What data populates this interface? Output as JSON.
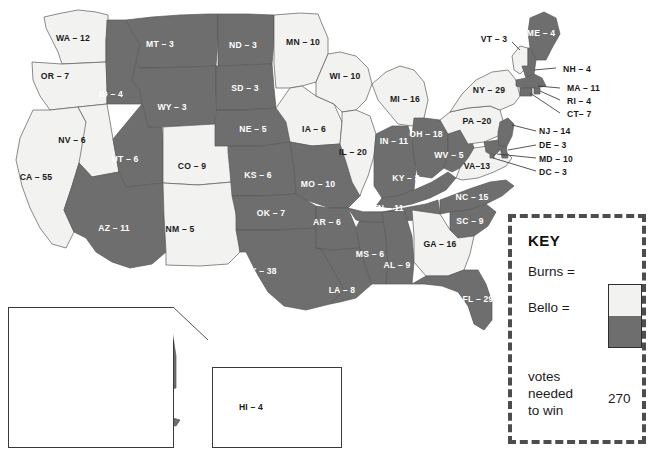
{
  "colors": {
    "burns": "#f2f2f0",
    "bello": "#6e6e6e",
    "background": "#ffffff",
    "border": "#5a5a5a",
    "key_border": "#4d4d4d"
  },
  "key": {
    "title": "KEY",
    "burns_label": "Burns =",
    "bello_label": "Bello =",
    "note_line1": "votes",
    "note_line2": "needed",
    "note_line3": "to win",
    "votes_needed": "270"
  },
  "states": [
    {
      "code": "WA",
      "votes": 12,
      "label": "WA – 12",
      "winner": "burns",
      "x": 73,
      "y": 38,
      "style": "lab-light"
    },
    {
      "code": "OR",
      "votes": 7,
      "label": "OR – 7",
      "winner": "burns",
      "x": 55,
      "y": 76,
      "style": "lab-light"
    },
    {
      "code": "CA",
      "votes": 55,
      "label": "CA – 55",
      "winner": "burns",
      "x": 36,
      "y": 177,
      "style": "lab-light"
    },
    {
      "code": "NV",
      "votes": 6,
      "label": "NV – 6",
      "winner": "burns",
      "x": 72,
      "y": 140,
      "style": "lab-light"
    },
    {
      "code": "ID",
      "votes": 4,
      "label": "ID – 4",
      "winner": "bello",
      "x": 111,
      "y": 94,
      "style": "lab-dark"
    },
    {
      "code": "MT",
      "votes": 3,
      "label": "MT – 3",
      "winner": "bello",
      "x": 160,
      "y": 44,
      "style": "lab-dark"
    },
    {
      "code": "WY",
      "votes": 3,
      "label": "WY – 3",
      "winner": "bello",
      "x": 172,
      "y": 107,
      "style": "lab-dark"
    },
    {
      "code": "UT",
      "votes": 6,
      "label": "UT – 6",
      "winner": "bello",
      "x": 125,
      "y": 159,
      "style": "lab-dark"
    },
    {
      "code": "CO",
      "votes": 9,
      "label": "CO – 9",
      "winner": "burns",
      "x": 192,
      "y": 166,
      "style": "lab-light"
    },
    {
      "code": "AZ",
      "votes": 11,
      "label": "AZ – 11",
      "winner": "bello",
      "x": 114,
      "y": 228,
      "style": "lab-dark"
    },
    {
      "code": "NM",
      "votes": 5,
      "label": "NM – 5",
      "winner": "burns",
      "x": 180,
      "y": 229,
      "style": "lab-light"
    },
    {
      "code": "ND",
      "votes": 3,
      "label": "ND – 3",
      "winner": "bello",
      "x": 243,
      "y": 45,
      "style": "lab-dark"
    },
    {
      "code": "SD",
      "votes": 3,
      "label": "SD – 3",
      "winner": "bello",
      "x": 245,
      "y": 88,
      "style": "lab-dark"
    },
    {
      "code": "NE",
      "votes": 5,
      "label": "NE – 5",
      "winner": "bello",
      "x": 253,
      "y": 129,
      "style": "lab-dark"
    },
    {
      "code": "KS",
      "votes": 6,
      "label": "KS – 6",
      "winner": "bello",
      "x": 258,
      "y": 175,
      "style": "lab-dark"
    },
    {
      "code": "OK",
      "votes": 7,
      "label": "OK – 7",
      "winner": "bello",
      "x": 271,
      "y": 213,
      "style": "lab-dark"
    },
    {
      "code": "TX",
      "votes": 38,
      "label": "TX – 38",
      "winner": "bello",
      "x": 261,
      "y": 271,
      "style": "lab-dark"
    },
    {
      "code": "MN",
      "votes": 10,
      "label": "MN – 10",
      "winner": "burns",
      "x": 303,
      "y": 42,
      "style": "lab-light"
    },
    {
      "code": "IA",
      "votes": 6,
      "label": "IA – 6",
      "winner": "burns",
      "x": 314,
      "y": 129,
      "style": "lab-light"
    },
    {
      "code": "MO",
      "votes": 10,
      "label": "MO – 10",
      "winner": "bello",
      "x": 318,
      "y": 184,
      "style": "lab-dark"
    },
    {
      "code": "AR",
      "votes": 6,
      "label": "AR – 6",
      "winner": "bello",
      "x": 327,
      "y": 222,
      "style": "lab-dark"
    },
    {
      "code": "LA",
      "votes": 8,
      "label": "LA – 8",
      "winner": "bello",
      "x": 342,
      "y": 290,
      "style": "lab-dark"
    },
    {
      "code": "WI",
      "votes": 10,
      "label": "WI – 10",
      "winner": "burns",
      "x": 345,
      "y": 76,
      "style": "lab-light"
    },
    {
      "code": "IL",
      "votes": 20,
      "label": "IL – 20",
      "winner": "burns",
      "x": 353,
      "y": 152,
      "style": "lab-light"
    },
    {
      "code": "MS",
      "votes": 6,
      "label": "MS – 6",
      "winner": "bello",
      "x": 370,
      "y": 254,
      "style": "lab-dark"
    },
    {
      "code": "TN",
      "votes": 11,
      "label": "TN – 11",
      "winner": "bello",
      "x": 388,
      "y": 208,
      "style": "lab-dark"
    },
    {
      "code": "MI",
      "votes": 16,
      "label": "MI – 16",
      "winner": "burns",
      "x": 405,
      "y": 99,
      "style": "lab-light"
    },
    {
      "code": "IN",
      "votes": 11,
      "label": "IN – 11",
      "winner": "bello",
      "x": 394,
      "y": 141,
      "style": "lab-dark"
    },
    {
      "code": "KY",
      "votes": 8,
      "label": "KY – 8",
      "winner": "bello",
      "x": 406,
      "y": 178,
      "style": "lab-dark"
    },
    {
      "code": "AL",
      "votes": 9,
      "label": "AL – 9",
      "winner": "bello",
      "x": 397,
      "y": 265,
      "style": "lab-dark"
    },
    {
      "code": "OH",
      "votes": 18,
      "label": "OH – 18",
      "winner": "bello",
      "x": 426,
      "y": 134,
      "style": "lab-dark"
    },
    {
      "code": "WV",
      "votes": 5,
      "label": "WV – 5",
      "winner": "bello",
      "x": 449,
      "y": 155,
      "style": "lab-dark"
    },
    {
      "code": "VA",
      "votes": 13,
      "label": "VA–13",
      "winner": "burns",
      "x": 477,
      "y": 166,
      "style": "lab-light"
    },
    {
      "code": "NC",
      "votes": 15,
      "label": "NC – 15",
      "winner": "bello",
      "x": 472,
      "y": 197,
      "style": "lab-dark"
    },
    {
      "code": "SC",
      "votes": 9,
      "label": "SC – 9",
      "winner": "bello",
      "x": 470,
      "y": 221,
      "style": "lab-dark"
    },
    {
      "code": "GA",
      "votes": 16,
      "label": "GA – 16",
      "winner": "burns",
      "x": 440,
      "y": 244,
      "style": "lab-light"
    },
    {
      "code": "FL",
      "votes": 29,
      "label": "FL – 29",
      "winner": "bello",
      "x": 478,
      "y": 299,
      "style": "lab-dark"
    },
    {
      "code": "PA",
      "votes": 20,
      "label": "PA –20",
      "winner": "burns",
      "x": 477,
      "y": 121,
      "style": "lab-light"
    },
    {
      "code": "NY",
      "votes": 29,
      "label": "NY – 29",
      "winner": "burns",
      "x": 489,
      "y": 90,
      "style": "lab-light"
    },
    {
      "code": "VT",
      "votes": 3,
      "label": "VT – 3",
      "winner": "burns",
      "x": 494,
      "y": 39,
      "style": "lab-light"
    },
    {
      "code": "ME",
      "votes": 4,
      "label": "ME – 4",
      "winner": "bello",
      "x": 541,
      "y": 33,
      "style": "lab-dark"
    },
    {
      "code": "AK",
      "votes": 3,
      "label": "AK – 3",
      "winner": "bello",
      "x": 115,
      "y": 357,
      "style": "lab-dark"
    },
    {
      "code": "HI",
      "votes": 4,
      "label": "HI – 4",
      "winner": "bello",
      "x": 251,
      "y": 407,
      "style": "lab-light"
    }
  ],
  "callout_states": [
    {
      "code": "NH",
      "votes": 4,
      "label": "NH – 4",
      "winner": "bello",
      "x": 563,
      "y": 69
    },
    {
      "code": "MA",
      "votes": 11,
      "label": "MA – 11",
      "winner": "bello",
      "x": 567,
      "y": 88
    },
    {
      "code": "RI",
      "votes": 4,
      "label": "RI – 4",
      "winner": "bello",
      "x": 567,
      "y": 101
    },
    {
      "code": "CT",
      "votes": 7,
      "label": "CT– 7",
      "winner": "bello",
      "x": 567,
      "y": 114
    },
    {
      "code": "NJ",
      "votes": 14,
      "label": "NJ – 14",
      "winner": "bello",
      "x": 539,
      "y": 131
    },
    {
      "code": "DE",
      "votes": 3,
      "label": "DE – 3",
      "winner": "bello",
      "x": 539,
      "y": 145
    },
    {
      "code": "MD",
      "votes": 10,
      "label": "MD – 10",
      "winner": "bello",
      "x": 539,
      "y": 159
    },
    {
      "code": "DC",
      "votes": 3,
      "label": "DC – 3",
      "winner": "bello",
      "x": 539,
      "y": 172
    }
  ]
}
